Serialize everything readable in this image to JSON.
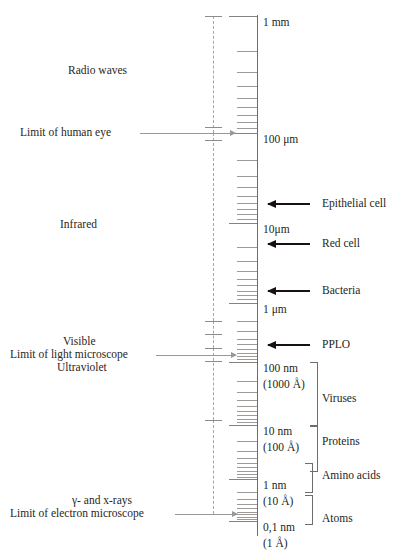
{
  "diagram": {
    "axis_type": "logarithmic",
    "units_top": "1 mm",
    "units_bottom": "0,1 nm"
  },
  "scale_labels": [
    {
      "id": "mm1",
      "text": "1 mm",
      "y": 16
    },
    {
      "id": "um100",
      "text": "100 μm",
      "y": 133
    },
    {
      "id": "um10",
      "text": "10μm",
      "y": 223
    },
    {
      "id": "um1",
      "text": "1 μm",
      "y": 303
    },
    {
      "id": "nm100",
      "text": "100 nm",
      "y": 362
    },
    {
      "id": "a1000",
      "text": "(1000 Å)",
      "y": 378
    },
    {
      "id": "nm10",
      "text": "10 nm",
      "y": 425
    },
    {
      "id": "a100",
      "text": "(100 Å)",
      "y": 441
    },
    {
      "id": "nm1",
      "text": "1 nm",
      "y": 479
    },
    {
      "id": "a10",
      "text": "(10 Å)",
      "y": 495
    },
    {
      "id": "nm01",
      "text": "0,1 nm",
      "y": 521
    },
    {
      "id": "a1",
      "text": "(1 Å)",
      "y": 537
    }
  ],
  "spectrum_labels": [
    {
      "id": "radio",
      "text": "Radio waves",
      "x": 68,
      "y": 64,
      "arrow": false
    },
    {
      "id": "human-eye",
      "text": "Limit of human eye",
      "x": 20,
      "y": 126,
      "arrow": true,
      "arrow_y": 133,
      "arrow_x": 140,
      "arrow_w": 95
    },
    {
      "id": "infrared",
      "text": "Infrared",
      "x": 60,
      "y": 218,
      "arrow": false
    },
    {
      "id": "visible",
      "text": "Visible",
      "x": 63,
      "y": 335,
      "arrow": false
    },
    {
      "id": "light-micro",
      "text": "Limit of light microscope",
      "x": 10,
      "y": 348,
      "arrow": true,
      "arrow_y": 355,
      "arrow_x": 156,
      "arrow_w": 80
    },
    {
      "id": "ultraviolet",
      "text": "Ultraviolet",
      "x": 57,
      "y": 361,
      "arrow": false
    },
    {
      "id": "gamma-xrays",
      "text": "γ-  and x-rays",
      "x": 72,
      "y": 494,
      "arrow": false
    },
    {
      "id": "electron-micro",
      "text": "Limit of electron microscope",
      "x": 10,
      "y": 507,
      "arrow": true,
      "arrow_y": 514,
      "arrow_x": 175,
      "arrow_w": 62
    }
  ],
  "objects": [
    {
      "id": "epithelial-cell",
      "text": "Epithelial cell",
      "label_x": 322,
      "label_y": 197,
      "arrow": true,
      "arrow_y": 203,
      "arrow_x": 268,
      "arrow_w": 42
    },
    {
      "id": "red-cell",
      "text": "Red cell",
      "label_x": 322,
      "label_y": 237,
      "arrow": true,
      "arrow_y": 243,
      "arrow_x": 268,
      "arrow_w": 42
    },
    {
      "id": "bacteria",
      "text": "Bacteria",
      "label_x": 322,
      "label_y": 284,
      "arrow": true,
      "arrow_y": 290,
      "arrow_x": 268,
      "arrow_w": 42
    },
    {
      "id": "pplo",
      "text": "PPLO",
      "label_x": 322,
      "label_y": 338,
      "arrow": true,
      "arrow_y": 344,
      "arrow_x": 268,
      "arrow_w": 42
    },
    {
      "id": "viruses",
      "text": "Viruses",
      "label_x": 322,
      "label_y": 392,
      "arrow": false
    },
    {
      "id": "proteins",
      "text": "Proteins",
      "label_x": 322,
      "label_y": 435,
      "arrow": false
    },
    {
      "id": "amino-acids",
      "text": "Amino acids",
      "label_x": 322,
      "label_y": 469,
      "arrow": false
    },
    {
      "id": "atoms",
      "text": "Atoms",
      "label_x": 322,
      "label_y": 512,
      "arrow": false
    }
  ],
  "brackets": [
    {
      "id": "viruses-bracket",
      "top": 362,
      "height": 63,
      "left": 310
    },
    {
      "id": "proteins-bracket",
      "top": 425,
      "height": 45,
      "left": 310
    },
    {
      "id": "amino-acids-bracket",
      "top": 463,
      "height": 28,
      "left": 305
    },
    {
      "id": "atoms-bracket",
      "top": 495,
      "height": 28,
      "left": 305
    }
  ],
  "dash_segments": [
    {
      "id": "radio-infrared-segment",
      "top": 16,
      "height": 117
    },
    {
      "id": "infrared-segment",
      "top": 133,
      "height": 188
    },
    {
      "id": "visible-segment",
      "top": 321,
      "height": 27
    },
    {
      "id": "uv-segment",
      "top": 348,
      "height": 72
    },
    {
      "id": "xray-segment",
      "top": 420,
      "height": 94
    }
  ],
  "dash_caps": [
    {
      "id": "cap-top",
      "y": 16
    },
    {
      "id": "cap-eye",
      "y": 127
    },
    {
      "id": "cap-eye-2",
      "y": 140
    },
    {
      "id": "cap-vis-1",
      "y": 321
    },
    {
      "id": "cap-vis-2",
      "y": 334
    },
    {
      "id": "cap-uv",
      "y": 348
    },
    {
      "id": "cap-uv-2",
      "y": 361
    },
    {
      "id": "cap-xray",
      "y": 420
    },
    {
      "id": "cap-bottom",
      "y": 514
    }
  ],
  "colors": {
    "ink": "#231f1c",
    "rule_gray": "#9d9a97",
    "arrow_gray": "#9a9794",
    "arrow_black": "#17120f"
  }
}
